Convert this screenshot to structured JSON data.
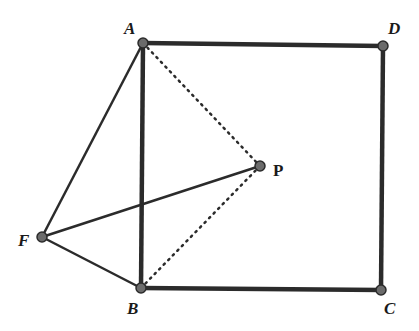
{
  "diagram": {
    "type": "geometry",
    "colors": {
      "line": "#2b2b2b",
      "point_fill": "#6b6b6b",
      "label": "#1a1a1a",
      "background": "#ffffff"
    },
    "points": [
      {
        "name": "A",
        "label": "A",
        "x": 143,
        "y": 43,
        "lx": 124,
        "ly": 34
      },
      {
        "name": "D",
        "label": "D",
        "x": 383,
        "y": 46,
        "lx": 388,
        "ly": 34
      },
      {
        "name": "C",
        "label": "C",
        "x": 381,
        "y": 290,
        "lx": 384,
        "ly": 314
      },
      {
        "name": "B",
        "label": "B",
        "x": 141,
        "y": 288,
        "lx": 127,
        "ly": 314
      },
      {
        "name": "P",
        "label": "P",
        "x": 260,
        "y": 166,
        "lx": 273,
        "ly": 176
      },
      {
        "name": "F",
        "label": "F",
        "x": 42,
        "y": 237,
        "lx": 18,
        "ly": 246
      }
    ],
    "segments": [
      {
        "from": "A",
        "to": "D",
        "style": "thick"
      },
      {
        "from": "D",
        "to": "C",
        "style": "thick"
      },
      {
        "from": "C",
        "to": "B",
        "style": "thick"
      },
      {
        "from": "B",
        "to": "A",
        "style": "thick"
      },
      {
        "from": "F",
        "to": "A",
        "style": "solid"
      },
      {
        "from": "F",
        "to": "B",
        "style": "solid"
      },
      {
        "from": "F",
        "to": "P",
        "style": "solid"
      },
      {
        "from": "A",
        "to": "P",
        "style": "dotted"
      },
      {
        "from": "B",
        "to": "P",
        "style": "dotted"
      }
    ]
  }
}
